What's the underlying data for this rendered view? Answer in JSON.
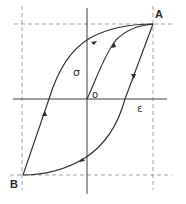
{
  "diagram": {
    "title": "",
    "labels": {
      "point_a": "A",
      "point_b": "B",
      "origin": "o",
      "stress_axis": "σ",
      "strain_axis": "ε"
    },
    "colors": {
      "line": "#2a2a2a",
      "dashed": "#8a8a8a",
      "background": "#ffffff"
    },
    "nodes": [
      {
        "id": "O",
        "label": "o",
        "x": 87,
        "y": 99
      },
      {
        "id": "A",
        "label": "A",
        "x": 153,
        "y": 24
      },
      {
        "id": "B",
        "label": "B",
        "x": 23,
        "y": 175
      }
    ],
    "edges": [
      {
        "from": "O",
        "to": "A",
        "kind": "initial loading curve",
        "arrow": "toward A"
      },
      {
        "from": "A",
        "to": "B",
        "kind": "unloading / reverse loading curve",
        "arrow": "toward B"
      },
      {
        "from": "B",
        "to": "A",
        "kind": "reloading curve",
        "arrow": "toward A"
      }
    ],
    "guides": [
      {
        "kind": "dashed-horizontal",
        "through": "A"
      },
      {
        "kind": "dashed-horizontal",
        "through": "B"
      },
      {
        "kind": "dashed-vertical",
        "through": "A"
      },
      {
        "kind": "dashed-vertical",
        "through": "B"
      }
    ]
  }
}
